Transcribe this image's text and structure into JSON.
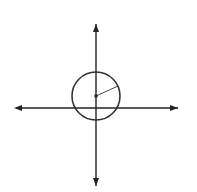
{
  "chart_data": {
    "type": "scatter",
    "xlabel": "x",
    "ylabel": "y",
    "xlim": [
      -12,
      12
    ],
    "ylim": [
      -12,
      12
    ],
    "grid": true,
    "grid_step": 2,
    "x_tick_labels": [
      "2",
      "4",
      "6",
      "8",
      "10"
    ],
    "y_tick_labels": [
      "2",
      "4",
      "6",
      "8",
      "10"
    ],
    "shapes": [
      {
        "kind": "circle",
        "center": [
          0,
          2
        ],
        "radius": 4,
        "radius_label": "4"
      }
    ],
    "points": [
      {
        "x": 0,
        "y": 2,
        "label": "center"
      }
    ]
  }
}
